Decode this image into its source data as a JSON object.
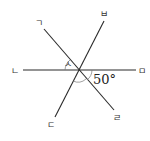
{
  "diagram": {
    "type": "intersecting-lines",
    "center": {
      "x": 79,
      "y": 70
    },
    "lines": [
      {
        "name": "line-nieun-mieum",
        "from": {
          "x": 23,
          "y": 70
        },
        "to": {
          "x": 136,
          "y": 70
        }
      },
      {
        "name": "line-giyeok-rieul",
        "from": {
          "x": 44,
          "y": 29
        },
        "to": {
          "x": 114,
          "y": 110
        }
      },
      {
        "name": "line-bieup-digeut",
        "from": {
          "x": 104,
          "y": 21
        },
        "to": {
          "x": 55,
          "y": 117
        }
      }
    ],
    "labels": {
      "giyeok": "ㄱ",
      "nieun": "ㄴ",
      "digeut": "ㄷ",
      "rieul": "ㄹ",
      "mieum": "ㅁ",
      "bieup": "ㅂ",
      "siot": "ㅅ"
    },
    "angle_value": "50°"
  }
}
